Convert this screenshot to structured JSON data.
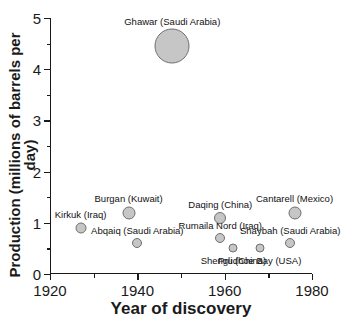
{
  "chart_data": {
    "type": "scatter",
    "title": "",
    "xlabel": "Year of discovery",
    "ylabel": "Production (millions of barrels per day)",
    "xlim": [
      1920,
      1980
    ],
    "ylim": [
      0,
      5
    ],
    "xticks": [
      1920,
      1930,
      1940,
      1950,
      1960,
      1970,
      1980
    ],
    "xtick_labels": [
      "1920",
      "",
      "1940",
      "",
      "1960",
      "",
      "1980"
    ],
    "yticks": [
      0,
      0.5,
      1,
      1.5,
      2,
      2.5,
      3,
      3.5,
      4,
      4.5,
      5
    ],
    "ytick_labels": [
      "0",
      "",
      "1",
      "",
      "2",
      "",
      "3",
      "",
      "4",
      "",
      "5"
    ],
    "grid": false,
    "legend": "none",
    "bubble_note": "marker size scales with production",
    "points": [
      {
        "label": "Kirkuk (Iraq)",
        "x": 1927,
        "y": 0.9,
        "size": 11,
        "label_pos": "above"
      },
      {
        "label": "Burgan (Kuwait)",
        "x": 1938,
        "y": 1.2,
        "size": 13,
        "label_pos": "above"
      },
      {
        "label": "Abqaiq (Saudi Arabia)",
        "x": 1940,
        "y": 0.6,
        "size": 10,
        "label_pos": "above"
      },
      {
        "label": "Ghawar (Saudi Arabia)",
        "x": 1948,
        "y": 4.45,
        "size": 35,
        "label_pos": "above"
      },
      {
        "label": "Daqing (China)",
        "x": 1959,
        "y": 1.1,
        "size": 12,
        "label_pos": "above"
      },
      {
        "label": "Rumaila Nord (Iraq)",
        "x": 1959,
        "y": 0.7,
        "size": 10,
        "label_pos": "above"
      },
      {
        "label": "Shengli (China)",
        "x": 1962,
        "y": 0.5,
        "size": 9,
        "label_pos": "below"
      },
      {
        "label": "Prudhoe Bay (USA)",
        "x": 1968,
        "y": 0.5,
        "size": 9,
        "label_pos": "below"
      },
      {
        "label": "Shaybah (Saudi Arabia)",
        "x": 1975,
        "y": 0.6,
        "size": 10,
        "label_pos": "above"
      },
      {
        "label": "Cantarell (Mexico)",
        "x": 1976,
        "y": 1.2,
        "size": 13,
        "label_pos": "above"
      }
    ],
    "colors": {
      "bubble_fill": "#c6c6c6",
      "bubble_stroke": "#6f6f6f",
      "axis": "#1a1a1a",
      "background": "#ffffff"
    }
  }
}
